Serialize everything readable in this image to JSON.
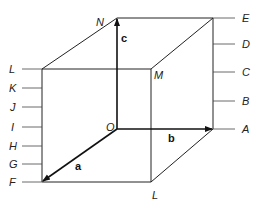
{
  "diagram": {
    "title": "",
    "vertices": {
      "origin": "O",
      "top_back_left": "N",
      "top_back_right": "E",
      "front_top_left": "L",
      "front_top_right": "M",
      "front_bottom_left": "F",
      "front_bottom_right": "L",
      "back_bottom_right": "A"
    },
    "vectors": [
      {
        "label": "a",
        "from": "O",
        "to": "F"
      },
      {
        "label": "b",
        "from": "O",
        "to": "A"
      },
      {
        "label": "c",
        "from": "O",
        "to": "N"
      }
    ],
    "left_scale_labels": [
      "L",
      "K",
      "J",
      "I",
      "H",
      "G",
      "F"
    ],
    "right_scale_labels": [
      "E",
      "D",
      "C",
      "B",
      "A"
    ]
  }
}
